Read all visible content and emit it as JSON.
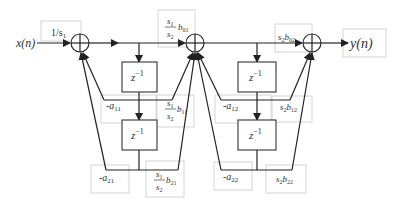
{
  "diagram": {
    "input": {
      "label": "x(n)"
    },
    "output": {
      "label": "y(n)"
    },
    "input_gain": {
      "label": "1/s",
      "sub": "1"
    },
    "delays": [
      {
        "label": "z",
        "sup": "−1"
      },
      {
        "label": "z",
        "sup": "−1"
      },
      {
        "label": "z",
        "sup": "−1"
      },
      {
        "label": "z",
        "sup": "−1"
      }
    ],
    "section1": {
      "b0": {
        "num": "s",
        "num_sub": "1",
        "den": "s",
        "den_sub": "2",
        "coef": "b",
        "coef_sub": "01"
      },
      "b1": {
        "num": "s",
        "num_sub": "1",
        "den": "s",
        "den_sub": "2",
        "coef": "b",
        "coef_sub": "11"
      },
      "b2": {
        "num": "s",
        "num_sub": "1",
        "den": "s",
        "den_sub": "2",
        "coef": "b",
        "coef_sub": "21"
      },
      "a1": {
        "prefix": "-",
        "coef": "a",
        "coef_sub": "11"
      },
      "a2": {
        "prefix": "-",
        "coef": "a",
        "coef_sub": "21"
      }
    },
    "section2": {
      "b0": {
        "gain": "s",
        "gain_sub": "2",
        "coef": "b",
        "coef_sub": "02"
      },
      "b1": {
        "gain": "s",
        "gain_sub": "2",
        "coef": "b",
        "coef_sub": "12"
      },
      "b2": {
        "gain": "s",
        "gain_sub": "2",
        "coef": "b",
        "coef_sub": "22"
      },
      "a1": {
        "prefix": "-",
        "coef": "a",
        "coef_sub": "12"
      },
      "a2": {
        "prefix": "-",
        "coef": "a",
        "coef_sub": "22"
      }
    },
    "colors": {
      "line": "#222222",
      "label_box": "#d4d4d4",
      "text": "#333333"
    }
  }
}
